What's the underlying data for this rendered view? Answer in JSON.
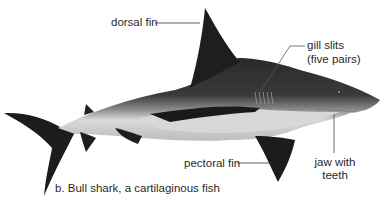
{
  "figure": {
    "caption": "b. Bull shark, a cartilaginous fish",
    "subject": "shark",
    "labels": {
      "dorsal_fin": "dorsal fin",
      "gill_slits_line1": "gill slits",
      "gill_slits_line2": "(five pairs)",
      "pectoral_fin": "pectoral fin",
      "jaw_line1": "jaw with",
      "jaw_line2": "teeth"
    }
  }
}
